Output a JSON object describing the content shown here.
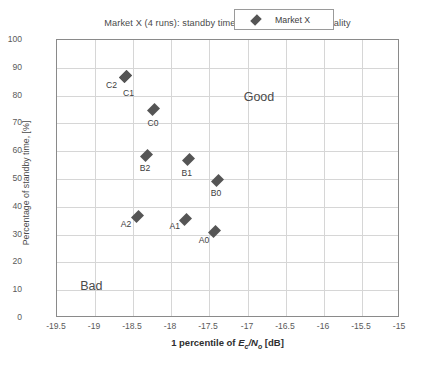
{
  "chart_data": {
    "type": "scatter",
    "title": "Market X (4 runs): standby time versus camping cell quality",
    "xlabel_parts": {
      "prefix": "1 percentile of ",
      "e": "E",
      "e_sub": "c",
      "slash": "/",
      "n": "N",
      "n_sub": "o",
      "suffix": " [dB]"
    },
    "xlabel": "1 percentile of Ec/No [dB]",
    "ylabel": "Percentage of standby time, [%]",
    "xlim": [
      -19.5,
      -15
    ],
    "ylim": [
      0,
      100
    ],
    "xticks": [
      "-19.5",
      "-19",
      "-18.5",
      "-18",
      "-17.5",
      "-17",
      "-16.5",
      "-16",
      "-15.5",
      "-15"
    ],
    "xtick_values": [
      -19.5,
      -19,
      -18.5,
      -18,
      -17.5,
      -17,
      -16.5,
      -16,
      -15.5,
      -15
    ],
    "yticks": [
      "0",
      "10",
      "20",
      "30",
      "40",
      "50",
      "60",
      "70",
      "80",
      "90",
      "100"
    ],
    "ytick_values": [
      0,
      10,
      20,
      30,
      40,
      50,
      60,
      70,
      80,
      90,
      100
    ],
    "grid": true,
    "legend": {
      "position": "upper right",
      "entries": [
        {
          "name": "Market X",
          "marker": "diamond",
          "color": "#555555"
        }
      ]
    },
    "series": [
      {
        "name": "Market X",
        "marker": "diamond",
        "color": "#555555",
        "points": [
          {
            "label": "C2",
            "x": -18.6,
            "y": 87.0,
            "label_dx": -14,
            "label_dy": 4
          },
          {
            "label": "C1",
            "x": -18.6,
            "y": 87.0,
            "label_dx": 3,
            "label_dy": 12
          },
          {
            "label": "C0",
            "x": -18.24,
            "y": 75.0,
            "label_dx": 0,
            "label_dy": 8
          },
          {
            "label": "B2",
            "x": -18.32,
            "y": 58.5,
            "label_dx": -2,
            "label_dy": 8
          },
          {
            "label": "B1",
            "x": -17.77,
            "y": 57.0,
            "label_dx": -2,
            "label_dy": 8
          },
          {
            "label": "B0",
            "x": -17.4,
            "y": 49.5,
            "label_dx": -1,
            "label_dy": 8
          },
          {
            "label": "A2",
            "x": -18.45,
            "y": 36.5,
            "label_dx": -11,
            "label_dy": 2
          },
          {
            "label": "A1",
            "x": -17.81,
            "y": 35.5,
            "label_dx": -11,
            "label_dy": 2
          },
          {
            "label": "A0",
            "x": -17.44,
            "y": 31.0,
            "label_dx": -10,
            "label_dy": 3
          }
        ]
      }
    ],
    "annotations": [
      {
        "text": "Good",
        "x": -16.85,
        "y": 79.5
      },
      {
        "text": "Bad",
        "x": -19.05,
        "y": 11.5
      }
    ]
  }
}
